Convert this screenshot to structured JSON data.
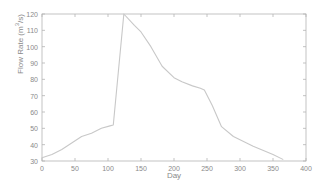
{
  "chart_data": {
    "type": "line",
    "title": "",
    "xlabel": "Day",
    "ylabel": "Flow Rate (m^3/s)",
    "ylabel_parts": {
      "prefix": "Flow Rate (m",
      "exponent": "3",
      "suffix": "/s)"
    },
    "xlim": [
      0,
      400
    ],
    "ylim": [
      30,
      120
    ],
    "xticks": [
      0,
      50,
      100,
      150,
      200,
      250,
      300,
      350,
      400
    ],
    "yticks": [
      30,
      40,
      50,
      60,
      70,
      80,
      90,
      100,
      110,
      120
    ],
    "grid": false,
    "legend": null,
    "line_color": "#c8c8c8",
    "axis_color": "#b4b4b4",
    "text_color": "#8a8a8a",
    "background": "#ffffff",
    "series": [
      {
        "name": "Flow Rate",
        "x": [
          0,
          15,
          30,
          45,
          60,
          75,
          90,
          103,
          108,
          124,
          140,
          150,
          165,
          182,
          200,
          212,
          228,
          240,
          246,
          258,
          272,
          290,
          320,
          350,
          365
        ],
        "y": [
          32,
          34,
          37,
          41,
          45,
          47,
          50,
          51.5,
          52,
          120,
          113,
          109,
          100,
          88,
          81,
          78.5,
          76,
          74.5,
          73.5,
          64,
          51,
          45,
          39,
          34,
          31
        ]
      }
    ],
    "annotations": []
  },
  "plot_geometry": {
    "left": 42,
    "right": 306,
    "top": 14,
    "bottom": 161
  }
}
